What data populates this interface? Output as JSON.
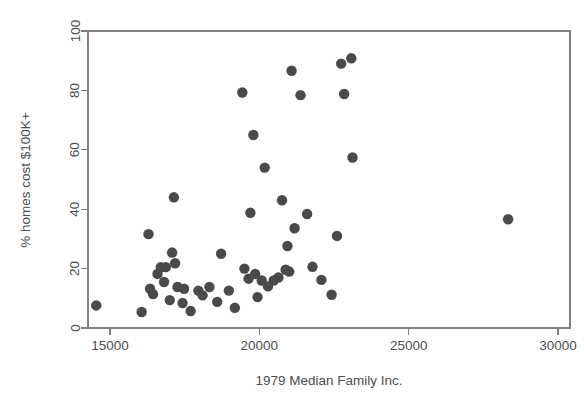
{
  "chart_data": {
    "type": "scatter",
    "title": "",
    "xlabel": "1979 Median Family Inc.",
    "ylabel": "% homes cost $100K+",
    "xlim": [
      14000,
      30500
    ],
    "ylim": [
      -2,
      103
    ],
    "xticks": [
      15000,
      20000,
      25000,
      30000
    ],
    "xtick_labels": [
      "15000",
      "20000",
      "25000",
      "30000"
    ],
    "yticks": [
      0,
      20,
      40,
      60,
      80,
      100
    ],
    "ytick_labels": [
      "0",
      "20",
      "40",
      "60",
      "80",
      "100"
    ],
    "grid": false,
    "legend": null,
    "marker": {
      "shape": "circle",
      "color": "#4a4a4a",
      "radius_px": 5.2
    },
    "frame": {
      "box": true,
      "color": "#808080"
    },
    "n_points": 52,
    "points": [
      {
        "x": 14540,
        "y": 7.6
      },
      {
        "x": 16060,
        "y": 5.4
      },
      {
        "x": 16290,
        "y": 31.6
      },
      {
        "x": 16340,
        "y": 13.2
      },
      {
        "x": 16440,
        "y": 11.4
      },
      {
        "x": 16590,
        "y": 18.2
      },
      {
        "x": 16700,
        "y": 20.5
      },
      {
        "x": 16810,
        "y": 15.5
      },
      {
        "x": 16870,
        "y": 20.5
      },
      {
        "x": 17000,
        "y": 9.4
      },
      {
        "x": 17080,
        "y": 25.4
      },
      {
        "x": 17140,
        "y": 44.0
      },
      {
        "x": 17180,
        "y": 21.8
      },
      {
        "x": 17260,
        "y": 13.8
      },
      {
        "x": 17430,
        "y": 8.4
      },
      {
        "x": 17480,
        "y": 13.2
      },
      {
        "x": 17700,
        "y": 5.7
      },
      {
        "x": 17960,
        "y": 12.6
      },
      {
        "x": 18100,
        "y": 11.0
      },
      {
        "x": 18330,
        "y": 13.8
      },
      {
        "x": 18590,
        "y": 8.8
      },
      {
        "x": 18720,
        "y": 25.0
      },
      {
        "x": 18980,
        "y": 12.6
      },
      {
        "x": 19180,
        "y": 6.8
      },
      {
        "x": 19430,
        "y": 79.3
      },
      {
        "x": 19500,
        "y": 20.0
      },
      {
        "x": 19640,
        "y": 16.6
      },
      {
        "x": 19700,
        "y": 38.8
      },
      {
        "x": 19800,
        "y": 65.0
      },
      {
        "x": 19860,
        "y": 18.2
      },
      {
        "x": 19940,
        "y": 10.4
      },
      {
        "x": 20080,
        "y": 16.0
      },
      {
        "x": 20180,
        "y": 54.0
      },
      {
        "x": 20290,
        "y": 14.0
      },
      {
        "x": 20480,
        "y": 16.0
      },
      {
        "x": 20640,
        "y": 17.0
      },
      {
        "x": 20760,
        "y": 43.0
      },
      {
        "x": 20880,
        "y": 19.6
      },
      {
        "x": 20940,
        "y": 27.6
      },
      {
        "x": 21000,
        "y": 19.0
      },
      {
        "x": 21080,
        "y": 86.6
      },
      {
        "x": 21180,
        "y": 33.6
      },
      {
        "x": 21380,
        "y": 78.4
      },
      {
        "x": 21600,
        "y": 38.4
      },
      {
        "x": 21780,
        "y": 20.6
      },
      {
        "x": 22080,
        "y": 16.2
      },
      {
        "x": 22420,
        "y": 11.2
      },
      {
        "x": 22600,
        "y": 31.0
      },
      {
        "x": 22740,
        "y": 89.0
      },
      {
        "x": 22840,
        "y": 78.8
      },
      {
        "x": 23080,
        "y": 90.8
      },
      {
        "x": 23120,
        "y": 57.4
      },
      {
        "x": 28330,
        "y": 36.6
      }
    ]
  },
  "figure": {
    "width": 584,
    "height": 400,
    "background": "#ffffff"
  }
}
